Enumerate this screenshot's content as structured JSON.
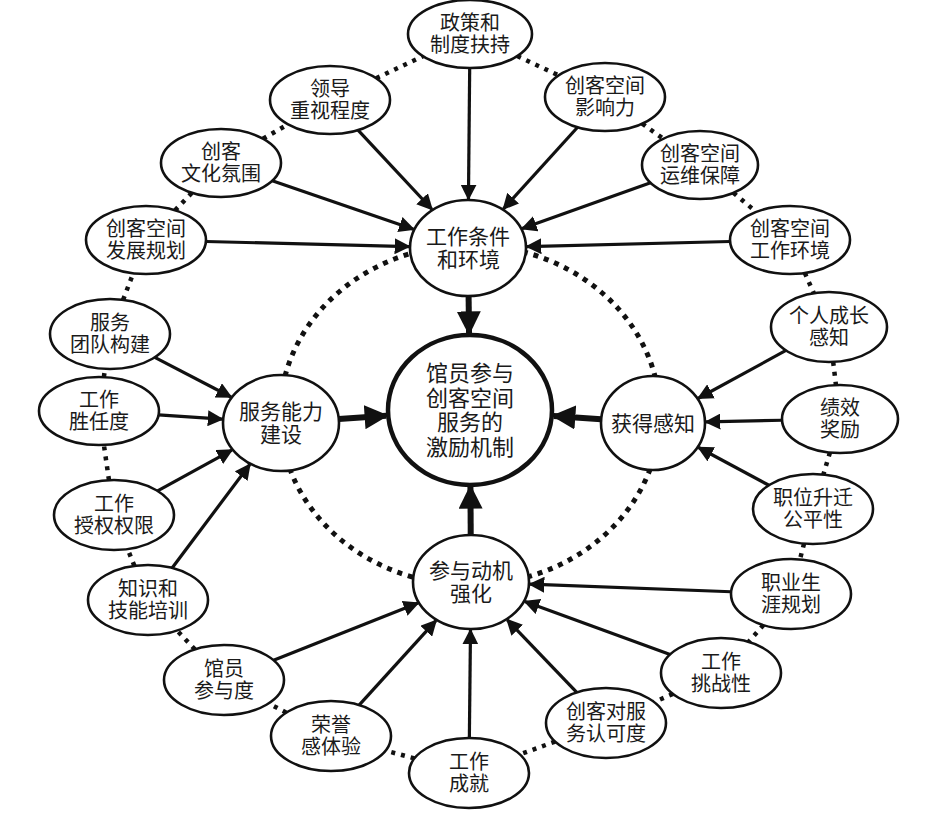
{
  "diagram": {
    "type": "concept-map",
    "center": {
      "id": "core",
      "lines": [
        "馆员参与",
        "创客空间",
        "服务的",
        "激励机制"
      ],
      "cx": 470,
      "cy": 410,
      "rx": 82,
      "ry": 75
    },
    "hubs": [
      {
        "id": "hub-env",
        "lines": [
          "工作条件",
          "和环境"
        ],
        "cx": 468,
        "cy": 248,
        "rx": 58,
        "ry": 48
      },
      {
        "id": "hub-ability",
        "lines": [
          "服务能力",
          "建设"
        ],
        "cx": 281,
        "cy": 423,
        "rx": 58,
        "ry": 48
      },
      {
        "id": "hub-perception",
        "lines": [
          "获得感知"
        ],
        "cx": 653,
        "cy": 423,
        "rx": 52,
        "ry": 47
      },
      {
        "id": "hub-motivation",
        "lines": [
          "参与动机",
          "强化"
        ],
        "cx": 471,
        "cy": 582,
        "rx": 58,
        "ry": 47
      }
    ],
    "factors": [
      {
        "id": "f-policy",
        "lines": [
          "政策和",
          "制度扶持"
        ],
        "cx": 470,
        "cy": 34,
        "rx": 62,
        "ry": 34,
        "target": "hub-env"
      },
      {
        "id": "f-leader",
        "lines": [
          "领导",
          "重视程度"
        ],
        "cx": 330,
        "cy": 100,
        "rx": 60,
        "ry": 34,
        "target": "hub-env"
      },
      {
        "id": "f-influence",
        "lines": [
          "创客空间",
          "影响力"
        ],
        "cx": 605,
        "cy": 97,
        "rx": 60,
        "ry": 34,
        "target": "hub-env"
      },
      {
        "id": "f-culture",
        "lines": [
          "创客",
          "文化氛围"
        ],
        "cx": 221,
        "cy": 163,
        "rx": 60,
        "ry": 34,
        "target": "hub-env"
      },
      {
        "id": "f-ops",
        "lines": [
          "创客空间",
          "运维保障"
        ],
        "cx": 700,
        "cy": 165,
        "rx": 58,
        "ry": 34,
        "target": "hub-env"
      },
      {
        "id": "f-devplan",
        "lines": [
          "创客空间",
          "发展规划"
        ],
        "cx": 146,
        "cy": 240,
        "rx": 60,
        "ry": 34,
        "target": "hub-env"
      },
      {
        "id": "f-workenv",
        "lines": [
          "创客空间",
          "工作环境"
        ],
        "cx": 790,
        "cy": 240,
        "rx": 60,
        "ry": 34,
        "target": "hub-env"
      },
      {
        "id": "f-team",
        "lines": [
          "服务",
          "团队构建"
        ],
        "cx": 110,
        "cy": 334,
        "rx": 60,
        "ry": 35,
        "target": "hub-ability"
      },
      {
        "id": "f-competence",
        "lines": [
          "工作",
          "胜任度"
        ],
        "cx": 99,
        "cy": 411,
        "rx": 60,
        "ry": 34,
        "target": "hub-ability"
      },
      {
        "id": "f-authority",
        "lines": [
          "工作",
          "授权权限"
        ],
        "cx": 114,
        "cy": 515,
        "rx": 60,
        "ry": 35,
        "target": "hub-ability"
      },
      {
        "id": "f-training",
        "lines": [
          "知识和",
          "技能培训"
        ],
        "cx": 148,
        "cy": 600,
        "rx": 60,
        "ry": 35,
        "target": "hub-ability"
      },
      {
        "id": "f-growth",
        "lines": [
          "个人成长",
          "感知"
        ],
        "cx": 829,
        "cy": 327,
        "rx": 58,
        "ry": 35,
        "target": "hub-perception"
      },
      {
        "id": "f-reward",
        "lines": [
          "绩效",
          "奖励"
        ],
        "cx": 840,
        "cy": 419,
        "rx": 58,
        "ry": 34,
        "target": "hub-perception"
      },
      {
        "id": "f-promotion",
        "lines": [
          "职位升迁",
          "公平性"
        ],
        "cx": 813,
        "cy": 509,
        "rx": 60,
        "ry": 35,
        "target": "hub-perception"
      },
      {
        "id": "f-career",
        "lines": [
          "职业生",
          "涯规划"
        ],
        "cx": 791,
        "cy": 594,
        "rx": 60,
        "ry": 35,
        "target": "hub-motivation"
      },
      {
        "id": "f-challenge",
        "lines": [
          "工作",
          "挑战性"
        ],
        "cx": 721,
        "cy": 673,
        "rx": 60,
        "ry": 35,
        "target": "hub-motivation"
      },
      {
        "id": "f-recognition",
        "lines": [
          "创客对服",
          "务认可度"
        ],
        "cx": 606,
        "cy": 723,
        "rx": 60,
        "ry": 35,
        "target": "hub-motivation"
      },
      {
        "id": "f-achievement",
        "lines": [
          "工作",
          "成就"
        ],
        "cx": 469,
        "cy": 773,
        "rx": 60,
        "ry": 35,
        "target": "hub-motivation"
      },
      {
        "id": "f-honor",
        "lines": [
          "荣誉",
          "感体验"
        ],
        "cx": 331,
        "cy": 736,
        "rx": 60,
        "ry": 35,
        "target": "hub-motivation"
      },
      {
        "id": "f-participation",
        "lines": [
          "馆员",
          "参与度"
        ],
        "cx": 224,
        "cy": 680,
        "rx": 60,
        "ry": 35,
        "target": "hub-motivation"
      }
    ],
    "outer_ring_order": [
      "f-policy",
      "f-influence",
      "f-ops",
      "f-workenv",
      "f-growth",
      "f-reward",
      "f-promotion",
      "f-career",
      "f-challenge",
      "f-recognition",
      "f-achievement",
      "f-honor",
      "f-participation",
      "f-training",
      "f-authority",
      "f-competence",
      "f-team",
      "f-devplan",
      "f-culture",
      "f-leader"
    ],
    "colors": {
      "stroke": "#111111",
      "fill": "#ffffff",
      "text": "#1a1a1a"
    }
  }
}
